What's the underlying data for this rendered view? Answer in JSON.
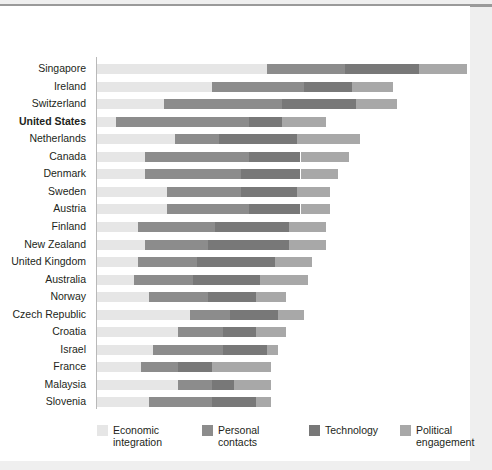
{
  "chart_data": {
    "type": "bar",
    "title": "",
    "subtitle": "",
    "xlabel": "",
    "ylabel": "",
    "orientation": "horizontal",
    "stacked": true,
    "grid": false,
    "legend_position": "bottom",
    "axis_max": 100,
    "highlighted_category": "United States",
    "categories": [
      "Singapore",
      "Ireland",
      "Switzerland",
      "United States",
      "Netherlands",
      "Canada",
      "Denmark",
      "Sweden",
      "Austria",
      "Finland",
      "New Zealand",
      "United Kingdom",
      "Australia",
      "Norway",
      "Czech Republic",
      "Croatia",
      "Israel",
      "France",
      "Malaysia",
      "Slovenia"
    ],
    "series": [
      {
        "name": "Economic integration",
        "color": "#e6e6e6",
        "values": [
          46,
          31,
          18,
          5,
          21,
          13,
          13,
          19,
          19,
          11,
          13,
          11,
          10,
          14,
          25,
          22,
          15,
          12,
          22,
          14
        ]
      },
      {
        "name": "Personal contacts",
        "color": "#8c8c8c",
        "values": [
          21,
          25,
          32,
          36,
          12,
          28,
          26,
          20,
          22,
          21,
          17,
          16,
          16,
          16,
          11,
          12,
          19,
          10,
          9,
          17
        ]
      },
      {
        "name": "Technology",
        "color": "#787878",
        "values": [
          20,
          13,
          20,
          9,
          21,
          14,
          16,
          15,
          14,
          20,
          22,
          21,
          18,
          13,
          13,
          9,
          12,
          9,
          6,
          12
        ]
      },
      {
        "name": "Political engagement",
        "color": "#a8a8a8",
        "values": [
          13,
          11,
          11,
          12,
          17,
          13,
          10,
          9,
          8,
          10,
          10,
          10,
          13,
          8,
          7,
          8,
          3,
          16,
          10,
          4
        ]
      }
    ],
    "totals": [
      100,
      80,
      81,
      62,
      71,
      68,
      65,
      63,
      63,
      62,
      62,
      58,
      57,
      51,
      56,
      51,
      49,
      47,
      47,
      47
    ]
  },
  "legend": {
    "items": [
      {
        "label": "Economic\nintegration",
        "color": "#e6e6e6"
      },
      {
        "label": "Personal\ncontacts",
        "color": "#8c8c8c"
      },
      {
        "label": "Technology",
        "color": "#787878"
      },
      {
        "label": "Political\nengagement",
        "color": "#a8a8a8"
      }
    ]
  }
}
